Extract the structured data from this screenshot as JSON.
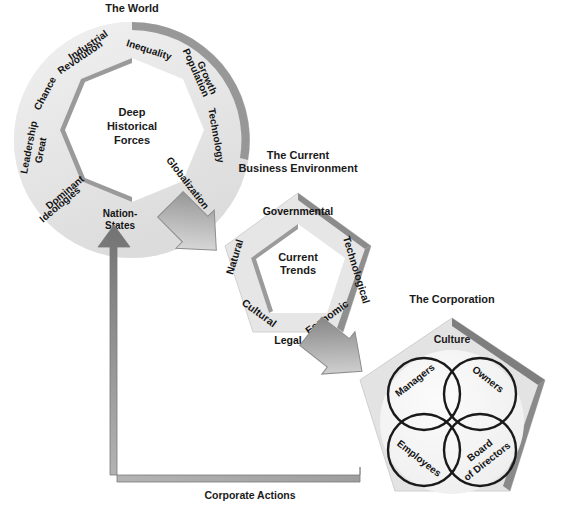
{
  "diagram": {
    "world": {
      "title": "The World",
      "center": [
        "Deep",
        "Historical",
        "Forces"
      ],
      "segments": [
        {
          "id": "industrial-revolution",
          "label": "Industrial Revolution",
          "lines": [
            "Industrial",
            "Revolution"
          ]
        },
        {
          "id": "inequality",
          "label": "Inequality",
          "lines": [
            "Inequality"
          ]
        },
        {
          "id": "population-growth",
          "label": "Population Growth",
          "lines": [
            "Population",
            "Growth"
          ]
        },
        {
          "id": "technology",
          "label": "Technology",
          "lines": [
            "Technology"
          ]
        },
        {
          "id": "globalization",
          "label": "Globalization",
          "lines": [
            "Globalization"
          ]
        },
        {
          "id": "nation-states",
          "label": "Nation-States",
          "lines": [
            "Nation-",
            "States"
          ]
        },
        {
          "id": "dominant-ideologies",
          "label": "Dominant Ideologies",
          "lines": [
            "Dominant",
            "Ideologies"
          ]
        },
        {
          "id": "great-leadership",
          "label": "Great Leadership",
          "lines": [
            "Great",
            "Leadership"
          ]
        },
        {
          "id": "chance",
          "label": "Chance",
          "lines": [
            "Chance"
          ]
        }
      ]
    },
    "business_environment": {
      "title_lines": [
        "The Current",
        "Business Environment"
      ],
      "title": "The Current Business Environment",
      "center": [
        "Current",
        "Trends"
      ],
      "segments": [
        {
          "id": "governmental",
          "label": "Governmental"
        },
        {
          "id": "technological",
          "label": "Technological"
        },
        {
          "id": "economic",
          "label": "Economic"
        },
        {
          "id": "legal",
          "label": "Legal"
        },
        {
          "id": "cultural",
          "label": "Cultural"
        },
        {
          "id": "natural",
          "label": "Natural"
        }
      ]
    },
    "corporation": {
      "title": "The Corporation",
      "culture_label": "Culture",
      "stakeholders": [
        {
          "id": "managers",
          "label": "Managers",
          "lines": [
            "Managers"
          ]
        },
        {
          "id": "owners",
          "label": "Owners",
          "lines": [
            "Owners"
          ]
        },
        {
          "id": "employees",
          "label": "Employees",
          "lines": [
            "Employees"
          ]
        },
        {
          "id": "board-of-directors",
          "label": "Board of Directors",
          "lines": [
            "Board",
            "of Directors"
          ]
        }
      ]
    },
    "flow": {
      "feedback_label": "Corporate Actions",
      "arrows": [
        {
          "id": "world-to-environment",
          "from": "The World",
          "to": "The Current Business Environment"
        },
        {
          "id": "environment-to-corporation",
          "from": "The Current Business Environment",
          "to": "The Corporation"
        },
        {
          "id": "corporate-actions-feedback",
          "from": "The Corporation",
          "to": "The World"
        }
      ]
    },
    "colors": {
      "band_light": "#e9e9e9",
      "band_mid": "#d3d3d3",
      "bevel_dark": "#8c8c8c",
      "bevel_darker": "#6f6f6f",
      "arrow_dark": "#737373",
      "arrow_light": "#e2e2e2",
      "outline": "#1a1a1a",
      "text": "#141414",
      "page_bg": "#ffffff"
    }
  }
}
